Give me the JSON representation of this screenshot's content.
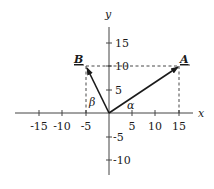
{
  "diagram": {
    "axes": {
      "x_label": "x",
      "y_label": "y",
      "x_ticks": [
        "-15",
        "-10",
        "-5",
        "5",
        "10",
        "15"
      ],
      "y_ticks": [
        "15",
        "10",
        "5",
        "-5",
        "-10"
      ]
    },
    "vectors": [
      {
        "name": "A",
        "from": [
          0,
          0
        ],
        "to": [
          15,
          10
        ]
      },
      {
        "name": "B",
        "from": [
          0,
          0
        ],
        "to": [
          -5,
          10
        ]
      }
    ],
    "angles": {
      "alpha": "α",
      "beta": "β"
    },
    "colors": {
      "line": "#1a1a1a",
      "axis": "#444444",
      "background": "#ffffff"
    }
  }
}
